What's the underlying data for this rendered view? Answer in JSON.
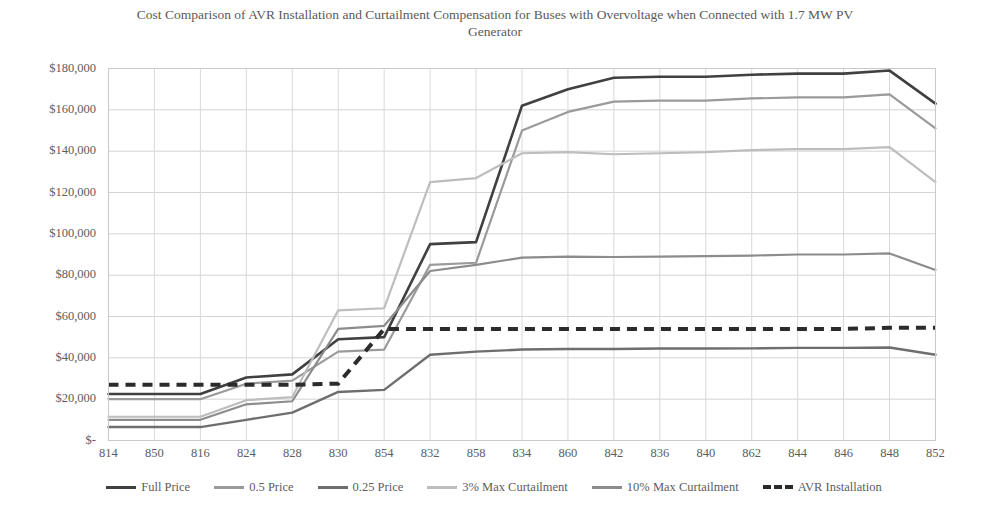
{
  "chart_data": {
    "type": "line",
    "title": "Cost Comparison of AVR Installation and Curtailment Compensation for Buses with Overvoltage when Connected with 1.7 MW PV Generator",
    "xlabel": "",
    "ylabel": "",
    "ylim": [
      0,
      180000
    ],
    "ytick_values": [
      0,
      20000,
      40000,
      60000,
      80000,
      100000,
      120000,
      140000,
      160000,
      180000
    ],
    "ytick_labels": [
      "$-",
      "$20,000",
      "$40,000",
      "$60,000",
      "$80,000",
      "$100,000",
      "$120,000",
      "$140,000",
      "$160,000",
      "$180,000"
    ],
    "grid": true,
    "legend_position": "bottom",
    "categories": [
      "814",
      "850",
      "816",
      "824",
      "828",
      "830",
      "854",
      "832",
      "858",
      "834",
      "860",
      "842",
      "836",
      "840",
      "862",
      "844",
      "846",
      "848",
      "852"
    ],
    "series": [
      {
        "name": "Full Price",
        "color": "#404040",
        "width": 2.6,
        "dash": "",
        "values": [
          22500,
          22500,
          22500,
          30500,
          32000,
          49000,
          50000,
          95000,
          96000,
          162000,
          170000,
          175500,
          176000,
          176000,
          177000,
          177500,
          177500,
          179000,
          163000
        ]
      },
      {
        "name": "0.5 Price",
        "color": "#9a9a9a",
        "width": 2.2,
        "dash": "",
        "values": [
          20000,
          20000,
          20000,
          27500,
          29000,
          43000,
          44000,
          85000,
          86000,
          150000,
          159000,
          164000,
          164500,
          164500,
          165500,
          166000,
          166000,
          167500,
          151000
        ]
      },
      {
        "name": "0.25 Price",
        "color": "#6e6e6e",
        "width": 2.4,
        "dash": "",
        "values": [
          6500,
          6500,
          6500,
          10000,
          13500,
          23500,
          24500,
          41500,
          43000,
          44000,
          44300,
          44300,
          44500,
          44500,
          44600,
          44800,
          44800,
          45000,
          41500
        ]
      },
      {
        "name": "3% Max Curtailment",
        "color": "#bdbdbd",
        "width": 2.2,
        "dash": "",
        "values": [
          11500,
          11500,
          11500,
          19500,
          21000,
          63000,
          64000,
          125000,
          127000,
          139000,
          139500,
          138500,
          139000,
          139500,
          140500,
          141000,
          141000,
          142000,
          125000
        ]
      },
      {
        "name": "10% Max Curtailment",
        "color": "#8c8c8c",
        "width": 2.2,
        "dash": "",
        "values": [
          10000,
          10000,
          10000,
          17500,
          19000,
          54000,
          55500,
          82000,
          85000,
          88500,
          89000,
          88800,
          89000,
          89200,
          89500,
          90000,
          90000,
          90500,
          82500
        ]
      },
      {
        "name": "AVR Installation",
        "color": "#2b2b2b",
        "width": 4,
        "dash": "10,7",
        "values": [
          27000,
          27000,
          27000,
          27000,
          27000,
          27500,
          54000,
          54000,
          54000,
          54000,
          54000,
          54000,
          54000,
          54000,
          54000,
          54000,
          54000,
          54500,
          54500
        ]
      }
    ]
  },
  "legend": {
    "items": [
      {
        "label": "Full Price",
        "color": "#404040",
        "dashed": false
      },
      {
        "label": "0.5 Price",
        "color": "#9a9a9a",
        "dashed": false
      },
      {
        "label": "0.25 Price",
        "color": "#6e6e6e",
        "dashed": false
      },
      {
        "label": "3% Max Curtailment",
        "color": "#bdbdbd",
        "dashed": false
      },
      {
        "label": "10% Max Curtailment",
        "color": "#8c8c8c",
        "dashed": false
      },
      {
        "label": "AVR Installation",
        "color": "#2b2b2b",
        "dashed": true
      }
    ]
  }
}
